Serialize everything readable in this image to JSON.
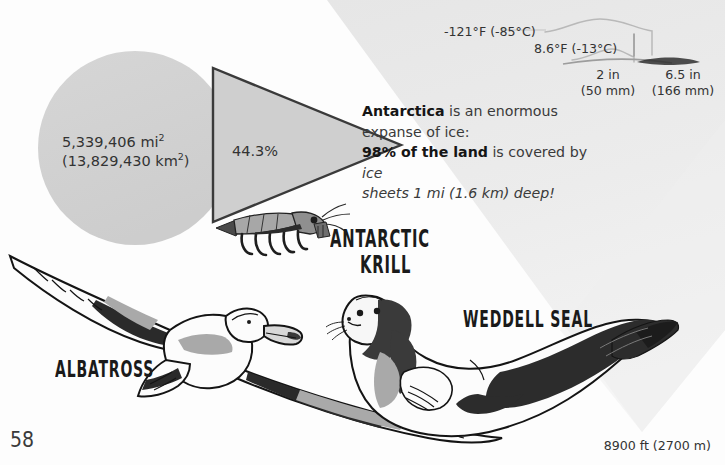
{
  "page": {
    "number": "58",
    "elevation": "8900 ft (2700 m)"
  },
  "stats": {
    "area_imperial": "5,339,406 mi",
    "area_imperial_unit": "2",
    "area_metric": "(13,829,430 km",
    "area_metric_unit": "2",
    "area_metric_close": ")",
    "percent": "44.3%"
  },
  "blurb": {
    "lead_bold": "Antarctica",
    "lead_rest": " is an enormous",
    "line2": "expanse of ice:",
    "line3_bold": "98% of the land",
    "line3_rest": " is covered by ",
    "line3_italic": "ice",
    "line4_italic": "sheets 1 mi (1.6 km) deep!"
  },
  "callouts": {
    "temp_low": "-121°F (-85°C)",
    "temp_high": "8.6°F (-13°C)",
    "snow_a_value": "2 in",
    "snow_a_metric": "(50 mm)",
    "snow_b_value": "6.5 in",
    "snow_b_metric": "(166 mm)"
  },
  "labels": {
    "krill_line1": "ANTARCTIC",
    "krill_line2": "KRILL",
    "seal": "WEDDELL SEAL",
    "albatross": "ALBATROSS"
  },
  "colors": {
    "background": "#fdfdfd",
    "wedge": "#e9e9e9",
    "circle": "#d2d2d2",
    "triangle_fill": "#cfcfcf",
    "triangle_stroke": "#3a3a3a",
    "ink": "#1a1a1a",
    "mid_gray": "#8e8e8e",
    "light_gray": "#c9c9c9",
    "text": "#333333"
  },
  "illustrations": {
    "krill": "antarctic-krill-illustration",
    "albatross": "albatross-illustration",
    "seal": "weddell-seal-illustration",
    "circle": "area-proportion-circle",
    "triangle": "percent-proportion-triangle",
    "snowdrift": "snow-depth-drift-lines"
  }
}
